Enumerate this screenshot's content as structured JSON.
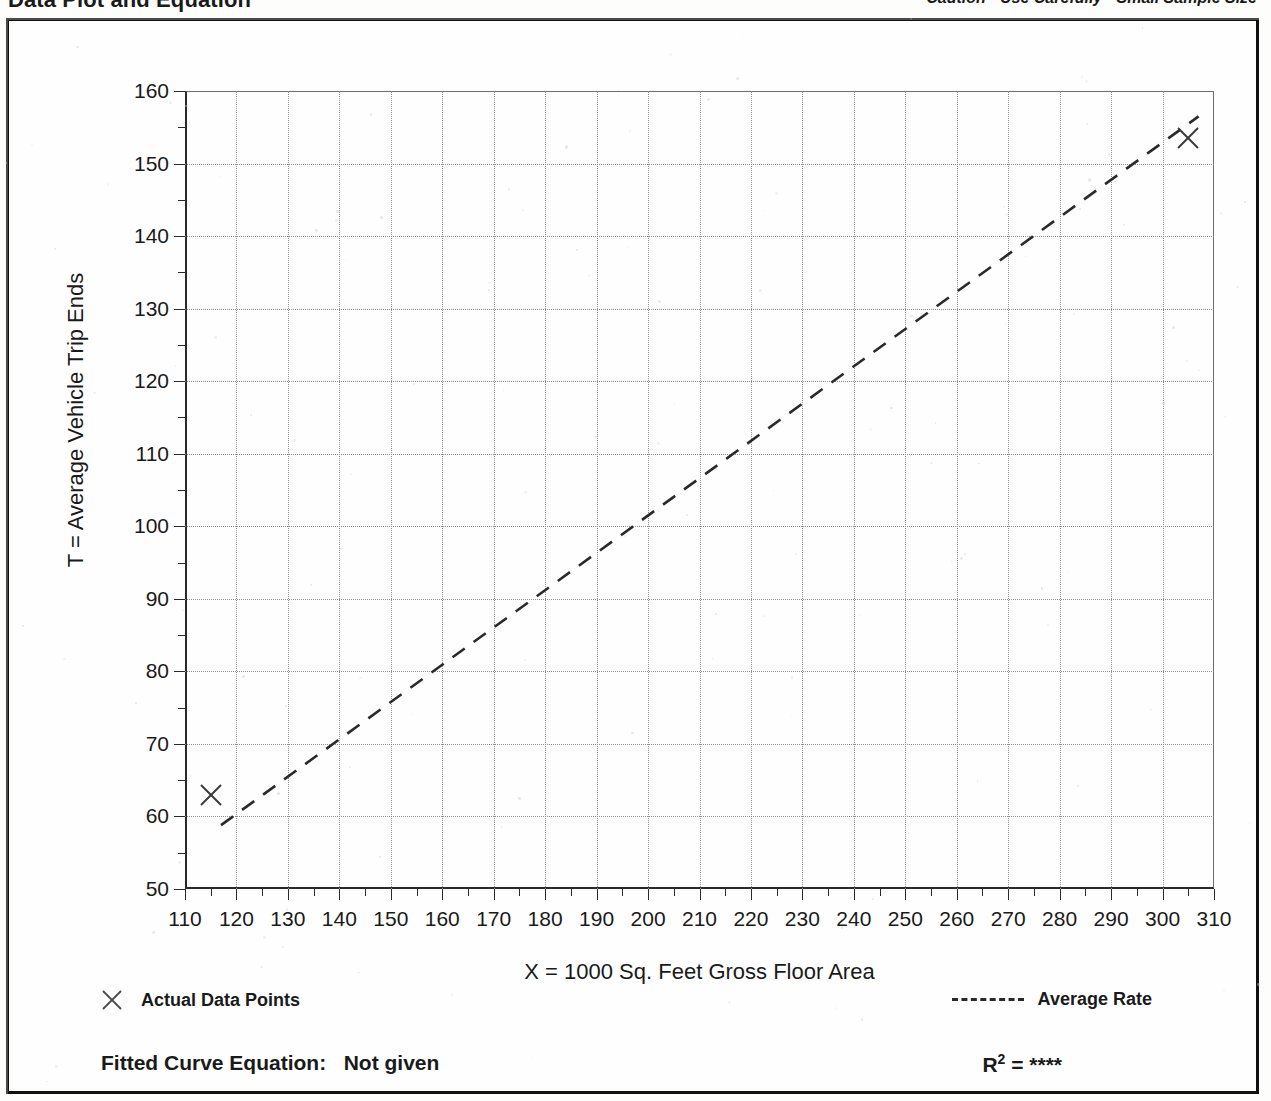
{
  "header": {
    "title": "Data Plot and Equation",
    "caution": "Caution - Use Carefully - Small Sample Size"
  },
  "legend": {
    "data_points_marker": "x-marker-icon",
    "data_points_label": "Actual Data Points",
    "average_rate_marker": "dashed-line-icon",
    "average_rate_label": "Average Rate",
    "fitted_equation_label": "Fitted Curve Equation:",
    "fitted_equation_value": "Not given",
    "r_squared_label": "R",
    "r_squared_exponent": "2",
    "r_squared_equals": "=",
    "r_squared_value": "****"
  },
  "chart_data": {
    "type": "scatter",
    "title": "Data Plot and Equation",
    "xlabel": "X = 1000 Sq. Feet Gross Floor Area",
    "ylabel": "T = Average Vehicle Trip Ends",
    "xlim": [
      110,
      310
    ],
    "ylim": [
      50,
      160
    ],
    "xticks": [
      110,
      120,
      130,
      140,
      150,
      160,
      170,
      180,
      190,
      200,
      210,
      220,
      230,
      240,
      250,
      260,
      270,
      280,
      290,
      300,
      310
    ],
    "yticks": [
      50,
      60,
      70,
      80,
      90,
      100,
      110,
      120,
      130,
      140,
      150,
      160
    ],
    "xtick_labels": [
      "110",
      "120",
      "130",
      "140",
      "150",
      "160",
      "170",
      "180",
      "190",
      "200",
      "210",
      "220",
      "230",
      "240",
      "250",
      "260",
      "270",
      "280",
      "290",
      "300",
      "310"
    ],
    "ytick_labels": [
      "50",
      "60",
      "70",
      "80",
      "90",
      "100",
      "110",
      "120",
      "130",
      "140",
      "150",
      "160"
    ],
    "x_minor_step": 5,
    "y_minor_step": 5,
    "grid": true,
    "grid_style": "dotted",
    "legend_position": "below-plot",
    "series": [
      {
        "name": "Actual Data Points",
        "type": "scatter",
        "marker": "x",
        "points": [
          {
            "x": 115,
            "y": 63
          },
          {
            "x": 305,
            "y": 153.5
          }
        ]
      },
      {
        "name": "Average Rate",
        "type": "line",
        "style": "dashed",
        "note": "straight average-rate line through origin",
        "points": [
          {
            "x": 117,
            "y": 58.8
          },
          {
            "x": 307,
            "y": 156.5
          }
        ]
      }
    ]
  },
  "colors": {
    "ink": "#1a1a1a",
    "axis": "#2a2a2a",
    "grid": "#8e8e8e",
    "marker": "#3a3a3a",
    "page": "#fdfdfc"
  }
}
